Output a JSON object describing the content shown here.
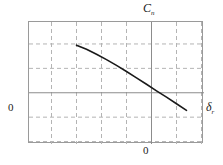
{
  "figure": {
    "background_color": "#ffffff",
    "frame_color": "#9a9a9a",
    "grid_color": "#b4b4b4",
    "axis_color": "#8c8c8c",
    "curve_color": "#1a1a1a"
  },
  "labels": {
    "y_axis_symbol": "C",
    "y_axis_subscript": "n",
    "x_axis_symbol": "δ",
    "x_axis_subscript": "r",
    "origin_y": "0",
    "origin_x": "0"
  },
  "chart_data": {
    "type": "line",
    "title": "",
    "xlabel": "δr",
    "ylabel": "Cn",
    "grid": true,
    "legend": null,
    "xlim": [
      -4.9,
      2.1
    ],
    "ylim": [
      -2.1,
      2.9
    ],
    "x_gridlines": [
      -4,
      -3,
      -2,
      -1,
      0,
      1,
      2
    ],
    "y_gridlines": [
      -2,
      -1,
      0,
      1,
      2
    ],
    "axis_origin": [
      0,
      0
    ],
    "series": [
      {
        "name": "Cn vs deltar",
        "x": [
          -3.0,
          -2.6,
          -2.2,
          -1.8,
          -1.4,
          -1.0,
          -0.6,
          -0.2,
          0.2,
          0.6,
          1.0,
          1.4
        ],
        "y": [
          1.95,
          1.78,
          1.58,
          1.36,
          1.12,
          0.87,
          0.61,
          0.35,
          0.08,
          -0.18,
          -0.45,
          -0.72
        ]
      }
    ]
  }
}
